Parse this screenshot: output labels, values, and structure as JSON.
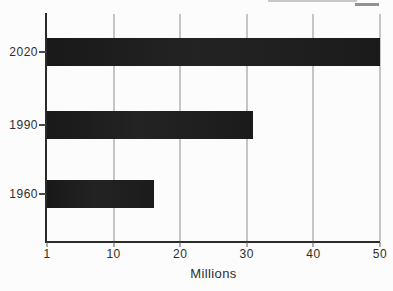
{
  "chart_data": {
    "type": "bar",
    "orientation": "horizontal",
    "categories": [
      "2020",
      "1990",
      "1960"
    ],
    "values": [
      50,
      31,
      16
    ],
    "title": "",
    "xlabel": "Millions",
    "ylabel": "",
    "x_ticks": [
      1,
      10,
      20,
      30,
      40,
      50
    ],
    "x_tick_labels": [
      "1",
      "10",
      "20",
      "30",
      "40",
      "50"
    ],
    "xlim": [
      1,
      50
    ],
    "grid": "vertical-gridlines-on",
    "legend": "none",
    "colors": {
      "bar": "#1d1d1d",
      "axis": "#2b2b2b",
      "gridline": "#8e8e8e",
      "text": "#2e2e2e",
      "background": "#fcfcfc"
    }
  }
}
